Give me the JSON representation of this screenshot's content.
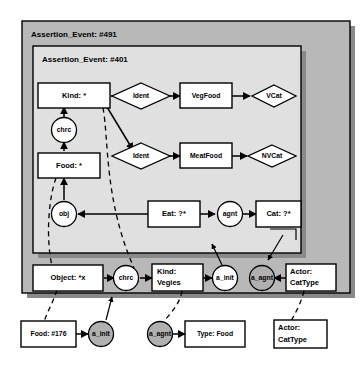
{
  "diagram": {
    "frames": [
      {
        "id": "outer",
        "label": "Assertion_Event: #491"
      },
      {
        "id": "inner",
        "label": "Assertion_Event: #401"
      }
    ],
    "nodes": {
      "kind_star": "Kind: *",
      "chrc_inner": "chrc",
      "food_star": "Food: *",
      "obj": "obj",
      "ident_top": "Ident",
      "ident_bottom": "Ident",
      "vegfood": "VegFood",
      "meatfood": "MeatFood",
      "vcat": "VCat",
      "nvcat": "NVCat",
      "eat": "Eat: ?*",
      "agnt": "agnt",
      "cat": "Cat: ?*",
      "object_x": "Object: *x",
      "chrc_outer": "chrc",
      "kind_vegies_line1": "Kind:",
      "kind_vegies_line2": "Vegies",
      "a_init_outer": "a_init",
      "a_agnt_outer": "a_agnt",
      "actor_cattype_line1": "Actor:",
      "actor_cattype_line2": "CatType",
      "food_176": "Food: #176",
      "a_init_bottom": "a_init",
      "a_agnt_bottom": "a_agnt",
      "type_food": "Type: Food",
      "actor_cattype_bottom_line1": "Actor:",
      "actor_cattype_bottom_line2": "CatType"
    },
    "colors": {
      "outer_frame_fill": "#b8b8b8",
      "inner_frame_fill": "#e0e0e0",
      "node_fill": "#ffffff",
      "gray_node_fill": "#b0b0b0",
      "stroke": "#000000",
      "page_background": "#ffffff"
    }
  }
}
